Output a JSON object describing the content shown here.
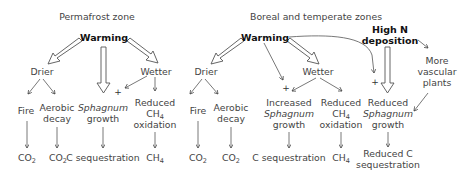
{
  "permafrost": {
    "title": "Permafrost zone",
    "warming": "Warming",
    "drier": "Drier",
    "wetter": "Wetter",
    "fire": "Fire",
    "aerobic": "Aerobic",
    "decay": "decay",
    "sphagnum": "Sphagnum",
    "growth": "growth",
    "reduced": "Reduced",
    "ch": "CH",
    "ch_sub": "4",
    "oxidation": "oxidation",
    "co": "CO",
    "co_sub": "2",
    "c_seq": "C sequestration",
    "plus": "+"
  },
  "boreal": {
    "title": "Boreal and temperate zones",
    "warming": "Warming",
    "high_n_1": "High N",
    "high_n_2": "deposition",
    "drier": "Drier",
    "wetter": "Wetter",
    "fire": "Fire",
    "aerobic": "Aerobic",
    "decay": "decay",
    "increased": "Increased",
    "sphagnum": "Sphagnum",
    "growth": "growth",
    "reduced": "Reduced",
    "ch": "CH",
    "ch_sub": "4",
    "oxidation": "oxidation",
    "co": "CO",
    "co_sub": "2",
    "c_seq": "C sequestration",
    "more": "More",
    "vascular": "vascular",
    "plants": "plants",
    "reduced_c": "Reduced C",
    "sequestration": "sequestration",
    "plus": "+"
  }
}
